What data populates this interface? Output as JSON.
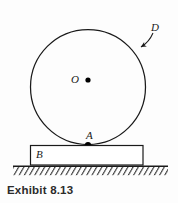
{
  "figure": {
    "caption": "Exhibit 8.13",
    "labels": {
      "center": "O",
      "contact_point": "A",
      "disk": "D",
      "block": "B"
    },
    "colors": {
      "stroke": "#1a1a1a",
      "background": "#fdfdfd",
      "point_fill": "#000000",
      "caption_text": "#2b2b2b"
    },
    "geometry": {
      "disk_center_x": 88,
      "disk_center_y": 87,
      "disk_radius": 58,
      "block_left": 30,
      "block_top": 145,
      "block_right": 143,
      "block_bottom": 165,
      "ground_line_y": 166,
      "ground_left": 13,
      "ground_right": 168,
      "contact_point_x": 88,
      "contact_point_y": 145
    },
    "icons": {
      "disk_outline": "circle-outline-icon",
      "center_dot": "center-point-icon",
      "contact_dot": "contact-point-icon",
      "leader": "leader-arrow-icon",
      "block_rect": "block-rectangle-icon",
      "ground": "hatched-ground-icon"
    }
  }
}
